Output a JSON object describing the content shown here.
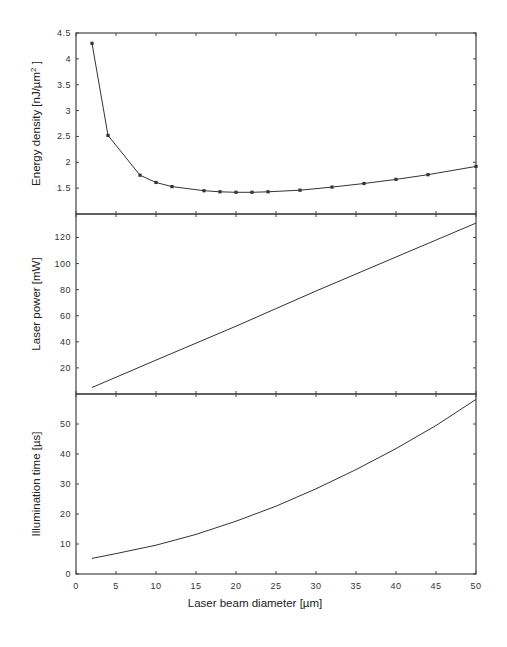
{
  "chart_data": [
    {
      "type": "line",
      "panel": "top",
      "ylabel": "Energy density [nJ/µm²]",
      "ylabel_parts": {
        "main": "Energy density [nJ/",
        "unit": "µm",
        "sup": "2",
        "end": " ]"
      },
      "ylim": [
        1.0,
        4.5
      ],
      "yticks": [
        1.5,
        2,
        2.5,
        3,
        3.5,
        4,
        4.5
      ],
      "ytick_labels": [
        "1.5",
        "2",
        "2.5",
        "3",
        "3.5",
        "4",
        "4.5"
      ],
      "markers": true,
      "x": [
        2,
        4,
        8,
        10,
        12,
        16,
        18,
        20,
        22,
        24,
        28,
        32,
        36,
        40,
        44,
        50
      ],
      "values": [
        4.3,
        2.52,
        1.75,
        1.61,
        1.53,
        1.45,
        1.43,
        1.42,
        1.42,
        1.43,
        1.46,
        1.52,
        1.59,
        1.67,
        1.76,
        1.92
      ]
    },
    {
      "type": "line",
      "panel": "middle",
      "ylabel": "Laser power [mW]",
      "ylim": [
        0,
        138
      ],
      "yticks": [
        20,
        40,
        60,
        80,
        100,
        120
      ],
      "ytick_labels": [
        "20",
        "40",
        "60",
        "80",
        "100",
        "120"
      ],
      "markers": false,
      "x": [
        2,
        10,
        20,
        30,
        40,
        50
      ],
      "values": [
        5,
        26,
        52,
        79,
        105,
        131
      ]
    },
    {
      "type": "line",
      "panel": "bottom",
      "ylabel": "Illumination time [µs]",
      "ylim": [
        0,
        60
      ],
      "yticks": [
        0,
        10,
        20,
        30,
        40,
        50
      ],
      "ytick_labels": [
        "0",
        "10",
        "20",
        "30",
        "40",
        "50"
      ],
      "markers": false,
      "x": [
        2,
        5,
        10,
        15,
        20,
        25,
        30,
        35,
        40,
        45,
        50
      ],
      "values": [
        5.2,
        6.8,
        9.6,
        13.2,
        17.6,
        22.6,
        28.4,
        34.8,
        41.8,
        49.5,
        58.2
      ]
    }
  ],
  "shared_x": {
    "xlabel": "Laser beam diameter [µm]",
    "xlim": [
      0,
      50
    ],
    "xticks": [
      0,
      5,
      10,
      15,
      20,
      25,
      30,
      35,
      40,
      45,
      50
    ],
    "xtick_labels": [
      "0",
      "5",
      "10",
      "15",
      "20",
      "25",
      "30",
      "35",
      "40",
      "45",
      "50"
    ]
  }
}
